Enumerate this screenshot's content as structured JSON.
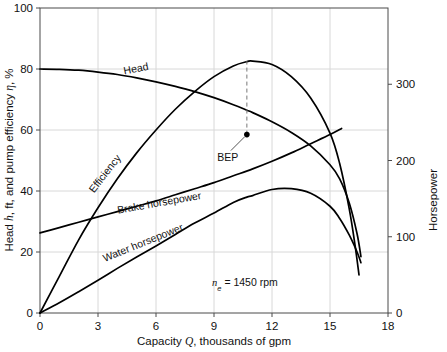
{
  "chart_data": {
    "type": "line",
    "title": "",
    "xlabel": "Capacity Q, thousands of gpm",
    "ylabel": "Head h, ft, and pump efficiency η, %",
    "y2label": "Horsepower",
    "xlim": [
      0,
      18
    ],
    "ylim": [
      0,
      100
    ],
    "y2lim": [
      0,
      400
    ],
    "xticks": [
      "0",
      "3",
      "6",
      "9",
      "12",
      "15",
      "18"
    ],
    "xtickvalues": [
      0,
      3,
      6,
      9,
      12,
      15,
      18
    ],
    "yticks": [
      "0",
      "20",
      "40",
      "60",
      "80",
      "100"
    ],
    "ytickvalues": [
      0,
      20,
      40,
      60,
      80,
      100
    ],
    "y2ticks": [
      "0",
      "100",
      "200",
      "300"
    ],
    "y2tickvalues": [
      0,
      100,
      200,
      300
    ],
    "grid": true,
    "legend_position": "inline-curve-labels",
    "annotations": [
      {
        "name": "speed-note",
        "text": "n",
        "subscript": "e",
        "rest": " = 1450 rpm",
        "full": "nₑ = 1450 rpm",
        "x": 10.6,
        "y": 9
      },
      {
        "name": "bep-marker",
        "text": "BEP",
        "x": 10.7,
        "y": 58.5,
        "marker": true
      }
    ],
    "series": [
      {
        "name": "Head",
        "label": "Head",
        "axis": "left",
        "units": "ft",
        "label_x": 5.0,
        "label_y": 79.0,
        "label_rotation": -11,
        "points": [
          [
            0.0,
            80.0
          ],
          [
            1.0,
            79.9
          ],
          [
            2.0,
            79.6
          ],
          [
            3.0,
            79.0
          ],
          [
            4.0,
            78.2
          ],
          [
            5.0,
            77.1
          ],
          [
            6.0,
            75.8
          ],
          [
            7.0,
            74.3
          ],
          [
            8.0,
            72.6
          ],
          [
            9.0,
            70.6
          ],
          [
            10.0,
            68.3
          ],
          [
            10.7,
            66.5
          ],
          [
            11.0,
            65.7
          ],
          [
            12.0,
            62.7
          ],
          [
            13.0,
            59.2
          ],
          [
            14.0,
            54.8
          ],
          [
            15.0,
            48.6
          ],
          [
            15.5,
            44.0
          ],
          [
            16.0,
            36.0
          ],
          [
            16.4,
            26.0
          ],
          [
            16.6,
            18.5
          ]
        ]
      },
      {
        "name": "Efficiency",
        "label": "Efficiency",
        "axis": "left",
        "units": "%",
        "label_x": 3.5,
        "label_y": 45.0,
        "label_rotation": -52,
        "points": [
          [
            0.0,
            0.0
          ],
          [
            1.0,
            12.0
          ],
          [
            2.0,
            24.0
          ],
          [
            3.0,
            34.5
          ],
          [
            4.0,
            44.0
          ],
          [
            5.0,
            52.5
          ],
          [
            6.0,
            60.0
          ],
          [
            7.0,
            66.8
          ],
          [
            8.0,
            72.6
          ],
          [
            9.0,
            77.5
          ],
          [
            10.0,
            81.0
          ],
          [
            10.7,
            82.4
          ],
          [
            11.0,
            82.6
          ],
          [
            12.0,
            81.5
          ],
          [
            13.0,
            77.5
          ],
          [
            14.0,
            70.5
          ],
          [
            15.0,
            59.0
          ],
          [
            15.5,
            49.0
          ],
          [
            16.0,
            34.0
          ],
          [
            16.3,
            22.0
          ],
          [
            16.5,
            12.5
          ]
        ]
      },
      {
        "name": "Brake horsepower",
        "label": "Brake horsepower",
        "axis": "right",
        "units": "hp",
        "label_x": 6.2,
        "label_y": 35.0,
        "label_rotation": -10,
        "points": [
          [
            0.0,
            105.0
          ],
          [
            1.0,
            112.0
          ],
          [
            2.0,
            119.0
          ],
          [
            3.0,
            126.0
          ],
          [
            4.0,
            133.0
          ],
          [
            5.0,
            140.0
          ],
          [
            6.0,
            147.0
          ],
          [
            7.0,
            155.0
          ],
          [
            8.0,
            163.0
          ],
          [
            9.0,
            171.0
          ],
          [
            10.0,
            180.0
          ],
          [
            11.0,
            189.0
          ],
          [
            12.0,
            199.0
          ],
          [
            13.0,
            210.0
          ],
          [
            14.0,
            222.0
          ],
          [
            15.0,
            234.0
          ],
          [
            15.6,
            242.0
          ]
        ]
      },
      {
        "name": "Water horsepower",
        "label": "Water horsepower",
        "axis": "right",
        "units": "hp",
        "label_x": 5.4,
        "label_y": 22.0,
        "label_rotation": -22,
        "points": [
          [
            0.0,
            0.0
          ],
          [
            1.0,
            13.5
          ],
          [
            2.0,
            28.0
          ],
          [
            3.0,
            43.0
          ],
          [
            4.0,
            58.5
          ],
          [
            5.0,
            73.5
          ],
          [
            6.0,
            88.0
          ],
          [
            7.0,
            103.0
          ],
          [
            8.0,
            118.0
          ],
          [
            9.0,
            131.0
          ],
          [
            10.0,
            145.0
          ],
          [
            10.7,
            152.0
          ],
          [
            11.0,
            154.0
          ],
          [
            12.0,
            162.0
          ],
          [
            13.0,
            163.0
          ],
          [
            14.0,
            157.0
          ],
          [
            15.0,
            140.0
          ],
          [
            15.5,
            124.0
          ],
          [
            16.0,
            102.0
          ],
          [
            16.4,
            80.0
          ],
          [
            16.6,
            66.0
          ]
        ]
      }
    ]
  },
  "axes": {
    "left_title": "Head h, ft, and pump efficiency η, %",
    "left_title_parts": {
      "pre": "Head ",
      "italic": "h",
      "mid": ", ft, and pump efficiency ",
      "eta": "η",
      "post": ", %"
    },
    "bottom_title": "Capacity Q, thousands of gpm",
    "bottom_title_parts": {
      "pre": "Capacity ",
      "italic": "Q",
      "post": ", thousands of gpm"
    },
    "right_title": "Horsepower"
  },
  "colors": {
    "background": "#ffffff",
    "curve": "#000000",
    "axis": "#4a4a4a",
    "grid": "#d8d8d8",
    "text": "#111111",
    "bep_leader": "#555555",
    "bep_dashed": "#777777"
  }
}
